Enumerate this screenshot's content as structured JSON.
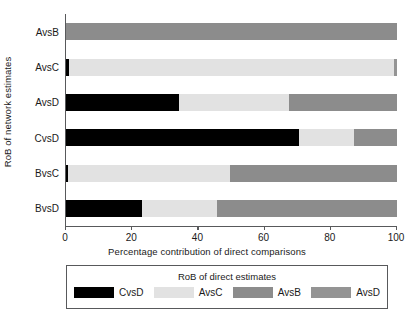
{
  "chart_data": {
    "type": "bar",
    "orientation": "horizontal",
    "stacked": true,
    "title": "",
    "xlabel": "Percentage contribution of direct comparisons",
    "ylabel": "RoB of network estimates",
    "xlim": [
      0,
      100
    ],
    "xticks": [
      0,
      20,
      40,
      60,
      80,
      100
    ],
    "xtick_labels": [
      "0",
      "20",
      "40",
      "60",
      "80",
      "100"
    ],
    "grid": false,
    "categories": [
      "AvsB",
      "AvsC",
      "AvsD",
      "CvsD",
      "BvsC",
      "BvsD"
    ],
    "legend_title": "RoB of direct estimates",
    "legend_position": "bottom",
    "series": [
      {
        "name": "CvsD",
        "color": "#000000",
        "values": [
          0,
          1,
          34,
          70.5,
          0.6,
          23
        ]
      },
      {
        "name": "AvsC",
        "color": "#e2e2e2",
        "values": [
          0,
          98,
          33.5,
          16.5,
          48.9,
          22.6
        ]
      },
      {
        "name": "AvsB",
        "color": "#8c8c8c",
        "values": [
          100,
          0,
          32.5,
          13,
          50.5,
          54.4
        ]
      },
      {
        "name": "AvsD",
        "color": "#949494",
        "values": [
          0,
          1,
          0,
          0,
          0,
          0
        ]
      }
    ],
    "bars": [
      {
        "category": "AvsB",
        "segments": [
          {
            "series": "AvsB",
            "value": 100,
            "color": "#8c8c8c"
          }
        ]
      },
      {
        "category": "AvsC",
        "segments": [
          {
            "series": "CvsD",
            "value": 1,
            "color": "#000000"
          },
          {
            "series": "AvsC",
            "value": 98,
            "color": "#e2e2e2"
          },
          {
            "series": "AvsD",
            "value": 1,
            "color": "#949494"
          }
        ]
      },
      {
        "category": "AvsD",
        "segments": [
          {
            "series": "CvsD",
            "value": 34,
            "color": "#000000"
          },
          {
            "series": "AvsC",
            "value": 33.5,
            "color": "#e2e2e2"
          },
          {
            "series": "AvsB",
            "value": 32.5,
            "color": "#8c8c8c"
          }
        ]
      },
      {
        "category": "CvsD",
        "segments": [
          {
            "series": "CvsD",
            "value": 70.5,
            "color": "#000000"
          },
          {
            "series": "AvsC",
            "value": 16.5,
            "color": "#e2e2e2"
          },
          {
            "series": "AvsB",
            "value": 13,
            "color": "#8c8c8c"
          }
        ]
      },
      {
        "category": "BvsC",
        "segments": [
          {
            "series": "CvsD",
            "value": 0.6,
            "color": "#000000"
          },
          {
            "series": "AvsC",
            "value": 48.9,
            "color": "#e2e2e2"
          },
          {
            "series": "AvsB",
            "value": 50.5,
            "color": "#8c8c8c"
          }
        ]
      },
      {
        "category": "BvsD",
        "segments": [
          {
            "series": "CvsD",
            "value": 23,
            "color": "#000000"
          },
          {
            "series": "AvsC",
            "value": 22.6,
            "color": "#e2e2e2"
          },
          {
            "series": "AvsB",
            "value": 54.4,
            "color": "#8c8c8c"
          }
        ]
      }
    ],
    "legend_entries": [
      {
        "label": "CvsD",
        "color": "#000000"
      },
      {
        "label": "AvsC",
        "color": "#e2e2e2"
      },
      {
        "label": "AvsB",
        "color": "#8c8c8c"
      },
      {
        "label": "AvsD",
        "color": "#949494"
      }
    ]
  },
  "axis": {
    "y_title": "RoB of network estimates",
    "x_title": "Percentage contribution of direct comparisons"
  },
  "colors": {
    "axis": "#58595b",
    "background": "#ffffff",
    "text": "#1a1a1a"
  }
}
